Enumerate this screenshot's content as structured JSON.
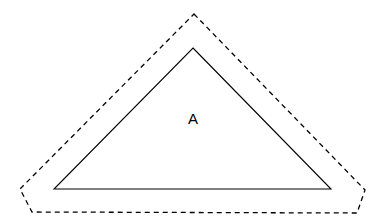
{
  "diagram": {
    "shapes": [
      {
        "id": "outer-offset-boundary",
        "kind": "polygon",
        "style": "dashed",
        "color": "#000000"
      },
      {
        "id": "triangle-A",
        "kind": "triangle",
        "style": "solid",
        "color": "#000000",
        "label": "A"
      }
    ]
  }
}
